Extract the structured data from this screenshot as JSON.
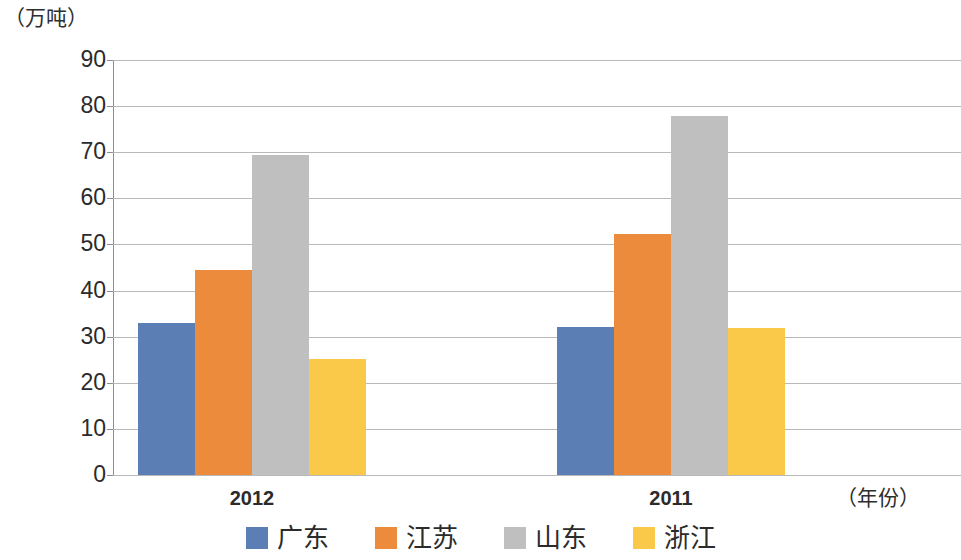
{
  "chart_data": {
    "type": "bar",
    "title": "",
    "subtitle": "",
    "xlabel": "（年份）",
    "ylabel": "（万吨）",
    "categories": [
      "2012",
      "2011"
    ],
    "series": [
      {
        "name": "广东",
        "color": "#5b7fb4",
        "values": [
          32.9,
          32.2
        ]
      },
      {
        "name": "江苏",
        "color": "#ed8b3c",
        "values": [
          44.4,
          52.3
        ]
      },
      {
        "name": "山东",
        "color": "#bfbfbf",
        "values": [
          69.3,
          77.8
        ]
      },
      {
        "name": "浙江",
        "color": "#fbc94a",
        "values": [
          25.2,
          31.9
        ]
      }
    ],
    "ylim": [
      0,
      90
    ],
    "ytick_labels": [
      "90",
      "80",
      "70",
      "60",
      "50",
      "40",
      "30",
      "20",
      "10",
      "0"
    ],
    "ytick_values": [
      90,
      80,
      70,
      60,
      50,
      40,
      30,
      20,
      10,
      0
    ],
    "grid": true,
    "grid_axis": "y",
    "legend_position": "bottom",
    "bar_group_gap": true
  }
}
